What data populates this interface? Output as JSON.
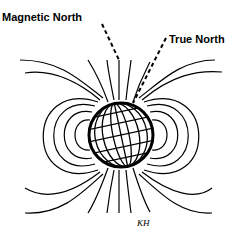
{
  "diagram": {
    "labels": {
      "magnetic_north": "Magnetic North",
      "true_north": "True North"
    },
    "signature": "KH",
    "colors": {
      "line": "#000000",
      "background": "#ffffff"
    }
  }
}
